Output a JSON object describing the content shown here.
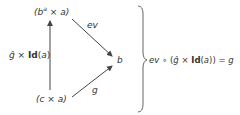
{
  "diagram": {
    "type": "commutative-triangle",
    "nodes": {
      "top": {
        "open": "(",
        "base": "b",
        "sup": "a",
        "times": " × ",
        "var": "a",
        "close": ")"
      },
      "right": {
        "label": "b"
      },
      "bottom": {
        "open": "(",
        "base": "c",
        "times": " × ",
        "var": "a",
        "close": ")"
      }
    },
    "edges": {
      "vertical": {
        "hat": "ĝ",
        "times": " × ",
        "id": "Id",
        "open": "(",
        "var": "a",
        "close": ")"
      },
      "top_to_right": {
        "label": "ev"
      },
      "bottom_to_right": {
        "label": "g"
      }
    },
    "equation": {
      "ev": "ev",
      "compose": " ∘ ",
      "open": "(",
      "hat": "ĝ",
      "times": " × ",
      "id": "Id",
      "inner_open": "(",
      "var": "a",
      "inner_close": "))",
      "equals": " = ",
      "rhs": "g"
    },
    "colors": {
      "stroke": "#444444",
      "text": "#333333"
    }
  }
}
